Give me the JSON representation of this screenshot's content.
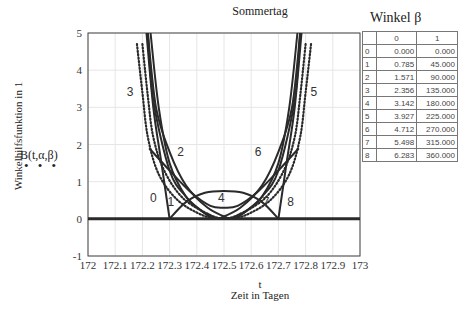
{
  "chart_data": {
    "type": "line",
    "title": "Sommertag",
    "xlabel_var": "t",
    "xlabel": "Zeit in Tagen",
    "ylabel": "Winkelhilfsfunktion in 1",
    "legend": [
      "B(t,α,β)"
    ],
    "xlim": [
      172,
      173
    ],
    "ylim": [
      -1,
      5
    ],
    "x_ticks": [
      "172",
      "172.1",
      "172.2",
      "172.3",
      "172.4",
      "172.5",
      "172.6",
      "172.7",
      "172.8",
      "172.9",
      "173"
    ],
    "y_ticks": [
      "-1",
      "0",
      "1",
      "2",
      "3",
      "4",
      "5"
    ],
    "grid": true,
    "series": [
      {
        "name": "0",
        "style": "solid",
        "points": [
          [
            172.215,
            5
          ],
          [
            172.24,
            3
          ],
          [
            172.27,
            1.5
          ],
          [
            172.3,
            0
          ]
        ],
        "label_at": [
          172.24,
          0.55
        ]
      },
      {
        "name": "0b",
        "style": "solid",
        "points": [
          [
            172.3,
            0
          ],
          [
            172.36,
            0.45
          ],
          [
            172.43,
            0.7
          ],
          [
            172.5,
            0.75
          ],
          [
            172.57,
            0.7
          ],
          [
            172.64,
            0.45
          ],
          [
            172.7,
            0
          ]
        ]
      },
      {
        "name": "1",
        "style": "solid",
        "points": [
          [
            172.22,
            5
          ],
          [
            172.24,
            3.2
          ],
          [
            172.3,
            1.3
          ],
          [
            172.36,
            0.6
          ],
          [
            172.42,
            0.2
          ],
          [
            172.46,
            0
          ]
        ],
        "label_at": [
          172.305,
          0.45
        ]
      },
      {
        "name": "2",
        "style": "solid",
        "points": [
          [
            172.22,
            5
          ],
          [
            172.25,
            3
          ],
          [
            172.3,
            1.8
          ],
          [
            172.36,
            0.9
          ],
          [
            172.44,
            0.3
          ],
          [
            172.52,
            0
          ]
        ],
        "label_at": [
          172.34,
          1.8
        ]
      },
      {
        "name": "2b",
        "style": "solid",
        "points": [
          [
            172.23,
            5
          ],
          [
            172.26,
            3
          ],
          [
            172.3,
            1.5
          ],
          [
            172.36,
            0.6
          ],
          [
            172.42,
            0.2
          ],
          [
            172.48,
            0
          ]
        ]
      },
      {
        "name": "3",
        "style": "dotted",
        "points": [
          [
            172.18,
            4.7
          ],
          [
            172.2,
            3.4
          ],
          [
            172.22,
            2.2
          ],
          [
            172.26,
            1.2
          ],
          [
            172.33,
            0.5
          ],
          [
            172.42,
            0.1
          ],
          [
            172.48,
            0
          ]
        ],
        "label_at": [
          172.155,
          3.4
        ]
      },
      {
        "name": "3b",
        "style": "dotted",
        "points": [
          [
            172.2,
            4.7
          ],
          [
            172.22,
            3.3
          ],
          [
            172.24,
            2.2
          ],
          [
            172.28,
            1.3
          ],
          [
            172.35,
            0.55
          ],
          [
            172.45,
            0.1
          ],
          [
            172.5,
            0
          ]
        ]
      },
      {
        "name": "4",
        "style": "solid",
        "points": [
          [
            172.225,
            1.9
          ],
          [
            172.3,
            1.3
          ],
          [
            172.38,
            0.7
          ],
          [
            172.45,
            0.35
          ],
          [
            172.5,
            0.3
          ],
          [
            172.55,
            0.35
          ],
          [
            172.62,
            0.7
          ],
          [
            172.7,
            1.3
          ],
          [
            172.775,
            1.9
          ]
        ],
        "label_at": [
          172.49,
          0.55
        ]
      },
      {
        "name": "5",
        "style": "dotted",
        "points": [
          [
            172.82,
            4.7
          ],
          [
            172.8,
            3.4
          ],
          [
            172.78,
            2.2
          ],
          [
            172.74,
            1.2
          ],
          [
            172.67,
            0.5
          ],
          [
            172.58,
            0.1
          ],
          [
            172.52,
            0
          ]
        ],
        "label_at": [
          172.83,
          3.4
        ]
      },
      {
        "name": "5b",
        "style": "dotted",
        "points": [
          [
            172.8,
            4.7
          ],
          [
            172.78,
            3.3
          ],
          [
            172.76,
            2.2
          ],
          [
            172.72,
            1.3
          ],
          [
            172.65,
            0.55
          ],
          [
            172.55,
            0.1
          ],
          [
            172.5,
            0
          ]
        ]
      },
      {
        "name": "6",
        "style": "solid",
        "points": [
          [
            172.78,
            5
          ],
          [
            172.75,
            3
          ],
          [
            172.7,
            1.8
          ],
          [
            172.64,
            0.9
          ],
          [
            172.56,
            0.3
          ],
          [
            172.48,
            0
          ]
        ],
        "label_at": [
          172.625,
          1.8
        ]
      },
      {
        "name": "6b",
        "style": "solid",
        "points": [
          [
            172.77,
            5
          ],
          [
            172.74,
            3
          ],
          [
            172.7,
            1.5
          ],
          [
            172.64,
            0.6
          ],
          [
            172.58,
            0.2
          ],
          [
            172.52,
            0
          ]
        ]
      },
      {
        "name": "7",
        "style": "solid",
        "points": [
          [
            172.78,
            5
          ],
          [
            172.76,
            3.2
          ],
          [
            172.7,
            1.3
          ],
          [
            172.64,
            0.6
          ],
          [
            172.58,
            0.2
          ],
          [
            172.54,
            0
          ]
        ],
        "label_at": [
          172.655,
          0.45
        ]
      },
      {
        "name": "8",
        "style": "solid",
        "points": [
          [
            172.785,
            5
          ],
          [
            172.76,
            3
          ],
          [
            172.73,
            1.5
          ],
          [
            172.7,
            0
          ]
        ],
        "label_at": [
          172.745,
          0.45
        ]
      },
      {
        "name": "zero",
        "style": "thick",
        "points": [
          [
            172,
            0
          ],
          [
            173,
            0
          ]
        ]
      }
    ]
  },
  "table": {
    "title": "Winkel β",
    "columns": [
      "",
      "0",
      "1"
    ],
    "rows": [
      [
        "0",
        "0.000",
        "0.000"
      ],
      [
        "1",
        "0.785",
        "45.000"
      ],
      [
        "2",
        "1.571",
        "90.000"
      ],
      [
        "3",
        "2.356",
        "135.000"
      ],
      [
        "4",
        "3.142",
        "180.000"
      ],
      [
        "5",
        "3.927",
        "225.000"
      ],
      [
        "6",
        "4.712",
        "270.000"
      ],
      [
        "7",
        "5.498",
        "315.000"
      ],
      [
        "8",
        "6.283",
        "360.000"
      ]
    ]
  },
  "legend_dots": "• • •"
}
